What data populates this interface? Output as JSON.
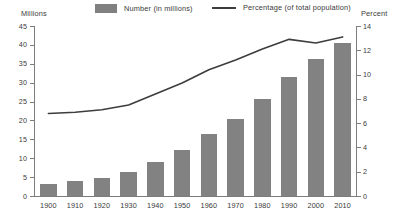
{
  "legend": {
    "number_label": "Number (in millions)",
    "percent_label": "Percentage (of total population)",
    "bar_color": "#828282",
    "line_color": "#3d3d3d"
  },
  "axes": {
    "left_title": "Millions",
    "right_title": "Percent",
    "left_ticks": [
      "0",
      "5",
      "10",
      "15",
      "20",
      "25",
      "30",
      "35",
      "40",
      "45"
    ],
    "right_ticks": [
      "0",
      "2",
      "4",
      "6",
      "8",
      "10",
      "12",
      "14"
    ]
  },
  "chart_data": {
    "type": "bar",
    "title": "",
    "subtitle": "",
    "xlabel": "",
    "ylabel": "Millions",
    "y2label": "Percent",
    "categories": [
      "1900",
      "1910",
      "1920",
      "1930",
      "1940",
      "1950",
      "1960",
      "1970",
      "1980",
      "1990",
      "2000",
      "2010"
    ],
    "ylim": [
      0,
      45
    ],
    "y2lim": [
      0,
      14
    ],
    "grid": false,
    "legend_position": "top",
    "series": [
      {
        "name": "Number (in millions)",
        "type": "bar",
        "axis": "left",
        "color": "#828282",
        "values": [
          3.2,
          4.0,
          4.8,
          6.3,
          9.0,
          12.3,
          16.5,
          20.3,
          25.8,
          31.4,
          36.2,
          40.4
        ]
      },
      {
        "name": "Percentage (of total population)",
        "type": "line",
        "axis": "right",
        "color": "#3d3d3d",
        "values": [
          6.8,
          6.9,
          7.1,
          7.5,
          8.4,
          9.3,
          10.4,
          11.2,
          12.1,
          12.9,
          12.6,
          13.1
        ]
      }
    ]
  }
}
